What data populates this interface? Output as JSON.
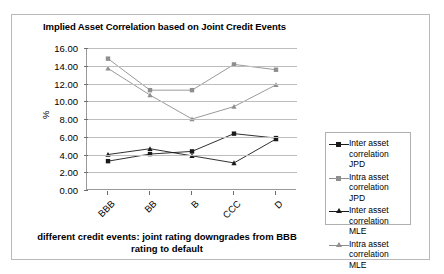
{
  "chart_data": {
    "type": "line",
    "title": "Implied Asset Correlation based on Joint Credit Events",
    "xlabel": "different credit events: joint rating downgrades from BBB rating to default",
    "ylabel": "%",
    "categories": [
      "BBB",
      "BB",
      "B",
      "CCC",
      "D"
    ],
    "ylim": [
      0,
      16
    ],
    "ytick_labels": [
      "0.00",
      "2.00",
      "4.00",
      "6.00",
      "8.00",
      "10.00",
      "12.00",
      "14.00",
      "16.00"
    ],
    "ytick_values": [
      0,
      2,
      4,
      6,
      8,
      10,
      12,
      14,
      16
    ],
    "grid": true,
    "legend_position": "right",
    "series": [
      {
        "name": "Inter asset correlation JPD",
        "marker": "square",
        "color": "#1a1a1a",
        "values": [
          3.25,
          4.05,
          4.35,
          6.35,
          5.85
        ]
      },
      {
        "name": "Intra asset correlation JPD",
        "marker": "square",
        "color": "#8f8f8f",
        "values": [
          14.8,
          11.25,
          11.25,
          14.15,
          13.55
        ]
      },
      {
        "name": "Inter asset correlation MLE",
        "marker": "triangle",
        "color": "#1a1a1a",
        "values": [
          4.0,
          4.65,
          3.85,
          3.05,
          5.75
        ]
      },
      {
        "name": "Intra asset correlation MLE",
        "marker": "triangle",
        "color": "#8f8f8f",
        "values": [
          13.7,
          10.7,
          8.0,
          9.4,
          11.85
        ]
      }
    ]
  }
}
